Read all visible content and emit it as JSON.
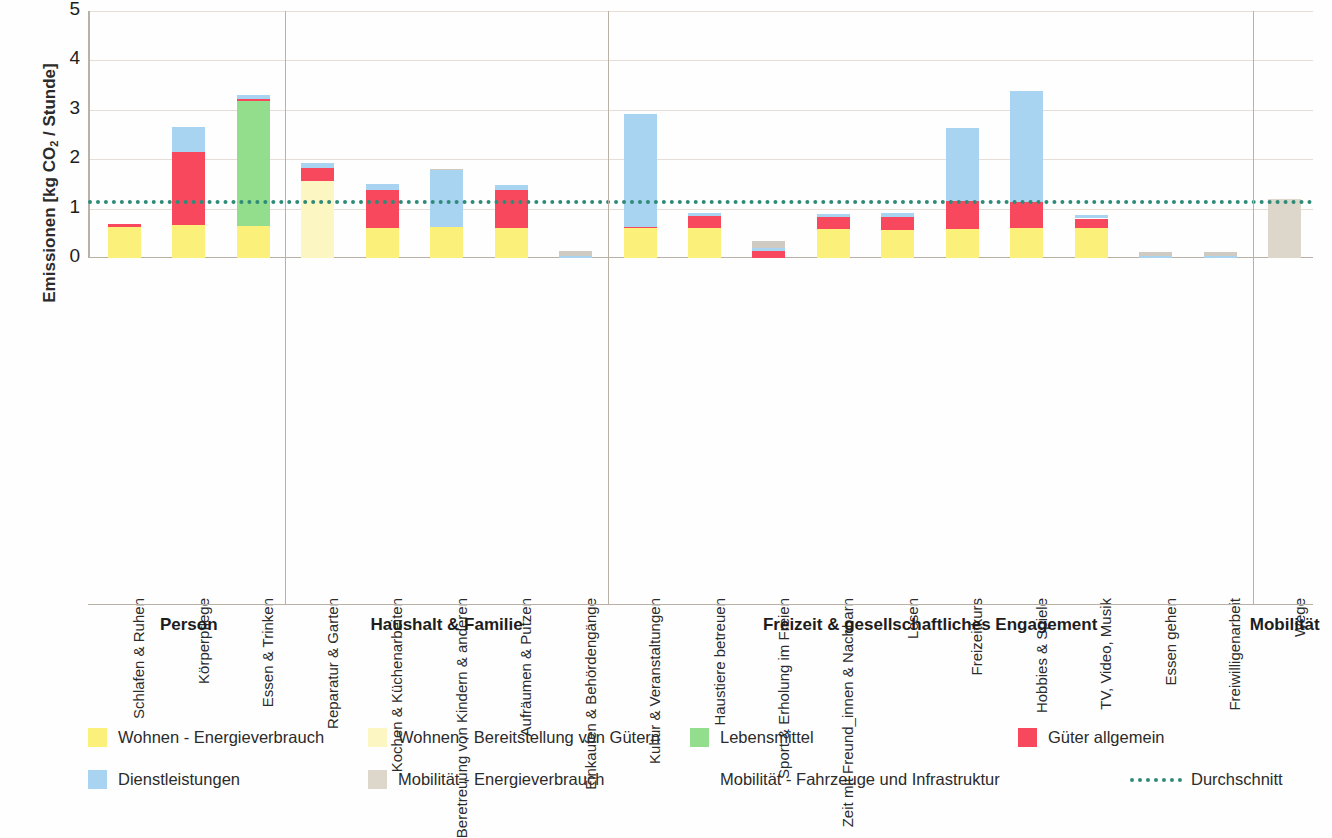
{
  "axis": {
    "y_title_main": "Emissionen [kg CO",
    "y_title_sub": "2",
    "y_title_tail": " / Stunde]",
    "y_ticks": [
      "5",
      "4",
      "3",
      "2",
      "1",
      "0"
    ]
  },
  "groups": [
    {
      "label": "Person"
    },
    {
      "label": "Haushalt & Familie"
    },
    {
      "label": "Freizeit & gesellschaftliches Engagement"
    },
    {
      "label": "Mobilität"
    }
  ],
  "legend": [
    {
      "name": "wohnen-energieverbrauch",
      "label": "Wohnen - Energieverbrauch",
      "color": "#fbf07a"
    },
    {
      "name": "wohnen-bereitstellung-gueter",
      "label": "Wohnen - Bereitstellung von Gütern",
      "color": "#fcf6c2"
    },
    {
      "name": "lebensmittel",
      "label": "Lebensmittel",
      "color": "#93de8d"
    },
    {
      "name": "gueter-allgemein",
      "label": "Güter allgemein",
      "color": "#f8485e"
    },
    {
      "name": "dienstleistungen",
      "label": "Dienstleistungen",
      "color": "#a8d4f2"
    },
    {
      "name": "mobilitaet-energieverbrauch",
      "label": "Mobilität - Energieverbrauch",
      "color": "#ddd6cb"
    },
    {
      "name": "mobilitaet-fahrzeuge-infrastruktur",
      "label": "Mobilität - Fahrzeuge und Infrastruktur",
      "color": "#ffffff"
    },
    {
      "name": "durchschnitt",
      "label": "Durchschnitt",
      "color": "#2e8b78"
    }
  ],
  "chart_data": {
    "type": "bar",
    "subtype": "stacked",
    "title": "",
    "xlabel": "",
    "ylabel": "Emissionen [kg CO2 / Stunde]",
    "ylim": [
      0,
      5
    ],
    "yticks": [
      0,
      1,
      2,
      3,
      4,
      5
    ],
    "grid": true,
    "legend_position": "bottom",
    "average_line": {
      "label": "Durchschnitt",
      "value": 1.18,
      "color": "#2e8b78",
      "style": "dotted"
    },
    "series": [
      {
        "name": "Wohnen - Energieverbrauch",
        "color": "#fbf07a"
      },
      {
        "name": "Wohnen - Bereitstellung von Gütern",
        "color": "#fcf6c2"
      },
      {
        "name": "Lebensmittel",
        "color": "#93de8d"
      },
      {
        "name": "Güter allgemein",
        "color": "#f8485e"
      },
      {
        "name": "Dienstleistungen",
        "color": "#a8d4f2"
      },
      {
        "name": "Mobilität - Energieverbrauch",
        "color": "#ddd6cb"
      },
      {
        "name": "Mobilität - Fahrzeuge und Infrastruktur",
        "color": "#ffffff"
      }
    ],
    "categories": [
      "Schlafen & Ruhen",
      "Körperpflege",
      "Essen & Trinken",
      "Reparatur & Garten",
      "Kochen & Küchenarbeiten",
      "Beretreuung von Kindern & anderen",
      "Aufräumen & Putzen",
      "Einkaufen & Behördengänge",
      "Kultur & Veranstaltungen",
      "Haustiere betreuen",
      "Sport & Erholung im Freien",
      "Zeit mit Freund_innen & Nachbarn",
      "Lesen",
      "Freizeitkurs",
      "Hobbies & Spiele",
      "TV, Video, Musik",
      "Essen gehen",
      "Freiwilligenarbeit",
      "Wege"
    ],
    "totals": [
      0.68,
      2.66,
      3.3,
      1.93,
      1.5,
      1.8,
      1.48,
      0.14,
      2.92,
      0.92,
      0.35,
      0.9,
      0.92,
      2.63,
      3.38,
      0.87,
      0.12,
      0.12,
      1.2
    ],
    "values": {
      "Wohnen - Energieverbrauch": [
        0.62,
        0.67,
        0.65,
        0.0,
        0.6,
        0.62,
        0.6,
        0.0,
        0.6,
        0.6,
        0.0,
        0.58,
        0.57,
        0.58,
        0.6,
        0.6,
        0.0,
        0.0,
        0.0
      ],
      "Wohnen - Bereitstellung von Gütern": [
        0.0,
        0.0,
        0.0,
        1.55,
        0.0,
        0.0,
        0.0,
        0.0,
        0.0,
        0.0,
        0.0,
        0.0,
        0.0,
        0.0,
        0.0,
        0.0,
        0.0,
        0.0,
        0.0
      ],
      "Lebensmittel": [
        0.0,
        0.0,
        2.53,
        0.0,
        0.0,
        0.0,
        0.0,
        0.0,
        0.0,
        0.0,
        0.0,
        0.0,
        0.0,
        0.0,
        0.0,
        0.0,
        0.0,
        0.0,
        0.0
      ],
      "Güter allgemein": [
        0.06,
        1.48,
        0.04,
        0.27,
        0.78,
        0.0,
        0.77,
        0.0,
        0.02,
        0.25,
        0.15,
        0.25,
        0.26,
        0.57,
        0.53,
        0.2,
        0.0,
        0.0,
        0.0
      ],
      "Dienstleistungen": [
        0.0,
        0.51,
        0.08,
        0.11,
        0.12,
        1.16,
        0.11,
        0.04,
        2.3,
        0.07,
        0.05,
        0.07,
        0.09,
        1.48,
        2.25,
        0.07,
        0.04,
        0.04,
        0.0
      ],
      "Mobilität - Energieverbrauch": [
        0.0,
        0.0,
        0.0,
        0.0,
        0.0,
        0.0,
        0.0,
        0.0,
        0.0,
        0.0,
        0.0,
        0.0,
        0.0,
        0.0,
        0.0,
        0.0,
        0.0,
        0.0,
        1.2
      ],
      "Mobilität - Fahrzeuge und Infrastruktur": [
        0.0,
        0.0,
        0.0,
        0.0,
        0.0,
        0.02,
        0.0,
        0.1,
        0.0,
        0.0,
        0.15,
        0.0,
        0.0,
        0.0,
        0.0,
        0.0,
        0.08,
        0.08,
        0.0
      ]
    },
    "group_spans": [
      {
        "label": "Person",
        "from": 0,
        "to": 2
      },
      {
        "label": "Haushalt & Familie",
        "from": 3,
        "to": 7
      },
      {
        "label": "Freizeit & gesellschaftliches Engagement",
        "from": 8,
        "to": 17
      },
      {
        "label": "Mobilität",
        "from": 18,
        "to": 18
      }
    ]
  }
}
